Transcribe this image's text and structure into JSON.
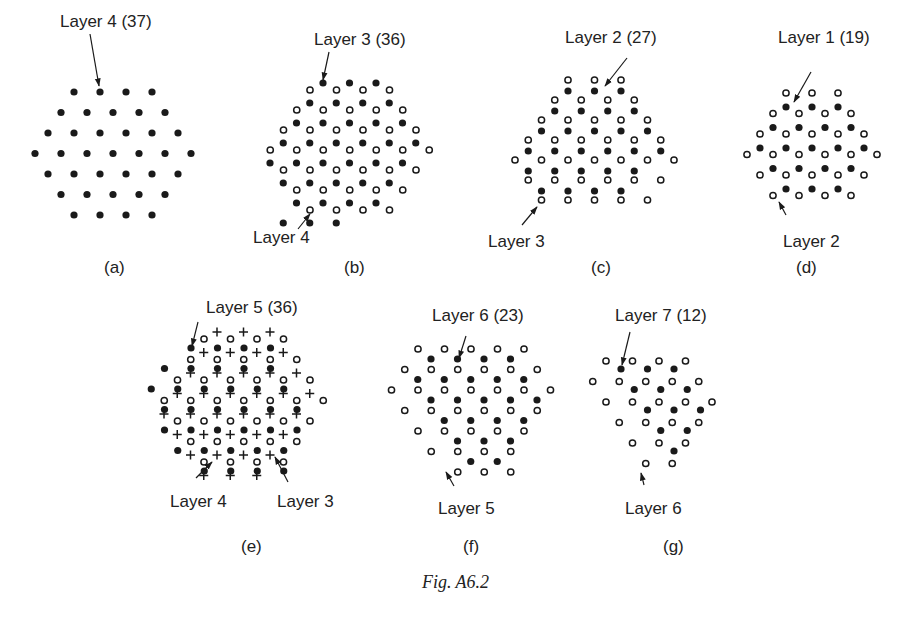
{
  "figure": {
    "caption": "Fig. A6.2",
    "panels": [
      {
        "id": "a",
        "label": "(a)",
        "label_pos": [
          104,
          258
        ],
        "annotations": [
          {
            "text": "Layer 4 (37)",
            "pos": [
              60,
              12
            ],
            "arrow": [
              [
                90,
                34
              ],
              [
                99,
                86
              ]
            ]
          }
        ],
        "layers": [
          {
            "name": "Layer 4",
            "count": 37,
            "marker": "filled",
            "origin": [
              74,
              92
            ],
            "dx": 26,
            "dy": 20.5,
            "rows": [
              [
                0,
                4
              ],
              [
                -0.5,
                5
              ],
              [
                -1,
                6
              ],
              [
                -1.5,
                7
              ],
              [
                -1,
                6
              ],
              [
                -0.5,
                5
              ],
              [
                0,
                4
              ]
            ]
          }
        ]
      },
      {
        "id": "b",
        "label": "(b)",
        "label_pos": [
          344,
          258
        ],
        "annotations": [
          {
            "text": "Layer 3 (36)",
            "pos": [
              314,
              30
            ],
            "arrow": [
              [
                329,
                52
              ],
              [
                323,
                80
              ]
            ]
          },
          {
            "text": "Layer 4",
            "pos": [
              253,
              228
            ],
            "arrow": [
              [
                298,
                229
              ],
              [
                310,
                214
              ]
            ]
          }
        ],
        "layers": [
          {
            "name": "Layer 3",
            "count": 36,
            "marker": "filled",
            "origin": [
              323,
              83
            ],
            "dx": 26.5,
            "dy": 20,
            "rows": [
              [
                0,
                3
              ],
              [
                -0.5,
                4
              ],
              [
                -1,
                5
              ],
              [
                -1.5,
                6
              ],
              [
                -2,
                6
              ],
              [
                -1.5,
                5
              ],
              [
                -1,
                4
              ],
              [
                -1.5,
                5
              ]
            ],
            "row_skip_last": true
          },
          {
            "name": "Layer 4",
            "count": 37,
            "marker": "open",
            "origin": [
              310,
              90
            ],
            "dx": 26.5,
            "dy": 20,
            "rows": [
              [
                0,
                4
              ],
              [
                -0.5,
                5
              ],
              [
                -1,
                6
              ],
              [
                -1.5,
                7
              ],
              [
                -1,
                6
              ],
              [
                -0.5,
                5
              ],
              [
                0,
                4
              ]
            ]
          }
        ]
      },
      {
        "id": "c",
        "label": "(c)",
        "label_pos": [
          591,
          258
        ],
        "annotations": [
          {
            "text": "Layer 2 (27)",
            "pos": [
              565,
              28
            ],
            "arrow": [
              [
                627,
                58
              ],
              [
                605,
                86
              ]
            ]
          },
          {
            "text": "Layer 3",
            "pos": [
              488,
              232
            ],
            "arrow": [
              [
                522,
                225
              ],
              [
                537,
                207
              ]
            ]
          }
        ],
        "layers": [
          {
            "name": "Layer 2",
            "count": 27,
            "marker": "filled",
            "origin": [
              568,
              91
            ],
            "dx": 26.5,
            "dy": 20,
            "rows": [
              [
                0,
                3
              ],
              [
                -0.5,
                4
              ],
              [
                -1,
                5
              ],
              [
                -1.5,
                6
              ],
              [
                -1.5,
                5
              ],
              [
                -1,
                4
              ]
            ]
          },
          {
            "name": "Layer 3",
            "count": 36,
            "marker": "open",
            "origin": [
              568,
              80
            ],
            "dx": 26.5,
            "dy": 20,
            "rows": [
              [
                0,
                3
              ],
              [
                -0.5,
                4
              ],
              [
                -1,
                5
              ],
              [
                -1.5,
                6
              ],
              [
                -2,
                7
              ],
              [
                -1.5,
                6
              ],
              [
                -1,
                5
              ]
            ]
          }
        ]
      },
      {
        "id": "d",
        "label": "(d)",
        "label_pos": [
          796,
          258
        ],
        "annotations": [
          {
            "text": "Layer 1 (19)",
            "pos": [
              778,
              28
            ],
            "arrow": [
              [
                811,
                72
              ],
              [
                794,
                102
              ]
            ]
          },
          {
            "text": "Layer 2",
            "pos": [
              783,
              232
            ],
            "arrow": [
              [
                786,
                215
              ],
              [
                779,
                202
              ]
            ]
          }
        ],
        "layers": [
          {
            "name": "Layer 1",
            "count": 19,
            "marker": "filled",
            "origin": [
              786,
              107
            ],
            "dx": 26,
            "dy": 20.5,
            "rows": [
              [
                0,
                3
              ],
              [
                -0.5,
                4
              ],
              [
                -1,
                5
              ],
              [
                -0.5,
                4
              ],
              [
                0,
                3
              ]
            ]
          },
          {
            "name": "Layer 2",
            "count": 27,
            "marker": "open",
            "origin": [
              786,
              93
            ],
            "dx": 26,
            "dy": 20.5,
            "rows": [
              [
                0,
                3
              ],
              [
                -0.5,
                4
              ],
              [
                -1,
                5
              ],
              [
                -1.5,
                6
              ],
              [
                -1,
                5
              ],
              [
                -0.5,
                4
              ]
            ]
          }
        ]
      },
      {
        "id": "e",
        "label": "(e)",
        "label_pos": [
          241,
          537
        ],
        "annotations": [
          {
            "text": "Layer 5 (36)",
            "pos": [
              206,
              298
            ],
            "arrow": [
              [
                198,
                322
              ],
              [
                192,
                346
              ]
            ]
          },
          {
            "text": "Layer 4",
            "pos": [
              170,
              492
            ],
            "arrow": [
              [
                196,
                478
              ],
              [
                212,
                462
              ]
            ]
          },
          {
            "text": "Layer 3",
            "pos": [
              277,
              492
            ],
            "arrow": [
              [
                288,
                482
              ],
              [
                275,
                457
              ]
            ]
          }
        ],
        "layers": [
          {
            "name": "Layer 5",
            "count": 36,
            "marker": "filled",
            "origin": [
              191,
              348
            ],
            "dx": 26.5,
            "dy": 20.5,
            "rows": [
              [
                0,
                4
              ],
              [
                -1,
                5
              ],
              [
                -1.5,
                6
              ],
              [
                -1,
                6
              ],
              [
                -1,
                6
              ],
              [
                -0.5,
                5
              ],
              [
                0.5,
                4
              ]
            ]
          },
          {
            "name": "Layer 4",
            "count": 37,
            "marker": "open",
            "origin": [
              204,
              339
            ],
            "dx": 26.5,
            "dy": 20.5,
            "rows": [
              [
                0,
                4
              ],
              [
                -0.5,
                5
              ],
              [
                -1,
                6
              ],
              [
                -1.5,
                7
              ],
              [
                -1,
                6
              ],
              [
                -0.5,
                5
              ],
              [
                0,
                4
              ]
            ]
          },
          {
            "name": "Layer 3",
            "count": 36,
            "marker": "plus",
            "origin": [
              217,
              332
            ],
            "dx": 26.5,
            "dy": 20.5,
            "rows": [
              [
                0,
                3
              ],
              [
                -0.5,
                4
              ],
              [
                -1,
                5
              ],
              [
                -1.5,
                6
              ],
              [
                -2,
                6
              ],
              [
                -1.5,
                5
              ],
              [
                -1,
                4
              ],
              [
                -0.5,
                3
              ]
            ]
          }
        ]
      },
      {
        "id": "f",
        "label": "(f)",
        "label_pos": [
          463,
          537
        ],
        "annotations": [
          {
            "text": "Layer 6 (23)",
            "pos": [
              432,
              306
            ],
            "arrow": [
              [
                466,
                336
              ],
              [
                459,
                358
              ]
            ]
          },
          {
            "text": "Layer 5",
            "pos": [
              438,
              499
            ],
            "arrow": [
              [
                454,
                486
              ],
              [
                446,
                472
              ]
            ]
          }
        ],
        "layers": [
          {
            "name": "Layer 6",
            "count": 23,
            "marker": "filled",
            "origin": [
              431,
              359
            ],
            "dx": 26.5,
            "dy": 20.5,
            "rows": [
              [
                0,
                4
              ],
              [
                -0.5,
                5
              ],
              [
                0,
                5
              ],
              [
                0.5,
                4
              ],
              [
                1,
                3
              ],
              [
                1.5,
                2
              ]
            ]
          },
          {
            "name": "Layer 5",
            "count": 36,
            "marker": "open",
            "origin": [
              418,
              349
            ],
            "dx": 26.5,
            "dy": 20.5,
            "rows": [
              [
                0,
                5
              ],
              [
                -0.5,
                6
              ],
              [
                -1,
                7
              ],
              [
                -0.5,
                6
              ],
              [
                0,
                5
              ],
              [
                0.5,
                4
              ],
              [
                1.5,
                3
              ]
            ]
          }
        ]
      },
      {
        "id": "g",
        "label": "(g)",
        "label_pos": [
          663,
          537
        ],
        "annotations": [
          {
            "text": "Layer 7 (12)",
            "pos": [
              615,
              306
            ],
            "arrow": [
              [
                630,
                332
              ],
              [
                622,
                365
              ]
            ]
          },
          {
            "text": "Layer 6",
            "pos": [
              625,
              499
            ],
            "arrow": [
              [
                644,
                485
              ],
              [
                641,
                473
              ]
            ]
          }
        ],
        "layers": [
          {
            "name": "Layer 7",
            "count": 12,
            "marker": "filled",
            "origin": [
              621,
              369
            ],
            "dx": 26.5,
            "dy": 20.5,
            "rows": [
              [
                0,
                3
              ],
              [
                0.5,
                3
              ],
              [
                1,
                3
              ],
              [
                1.5,
                2
              ],
              [
                2,
                1
              ]
            ]
          },
          {
            "name": "Layer 6",
            "count": 23,
            "marker": "open",
            "origin": [
              606,
              361
            ],
            "dx": 26.5,
            "dy": 20.5,
            "rows": [
              [
                0,
                4
              ],
              [
                -0.5,
                5
              ],
              [
                0,
                5
              ],
              [
                0.5,
                4
              ],
              [
                1,
                3
              ],
              [
                1.5,
                2
              ]
            ]
          }
        ]
      }
    ]
  }
}
